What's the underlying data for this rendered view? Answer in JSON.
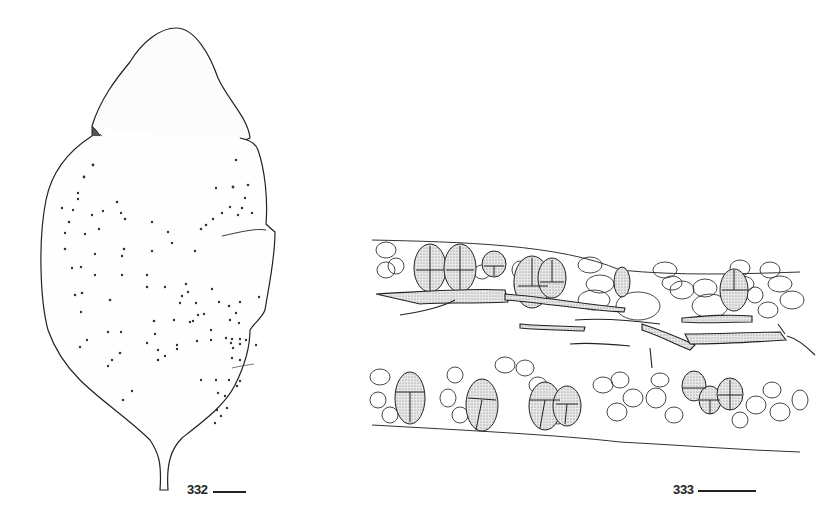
{
  "plate": {
    "figures": [
      {
        "number": "332",
        "label": "332",
        "subject": "leaf-like body with overlapping lobes and scattered dots",
        "scale_bar": "scale-bar"
      },
      {
        "number": "333",
        "label": "333",
        "subject": "cross-section strip with cells, stippled segmented cells and central filaments",
        "scale_bar": "scale-bar"
      }
    ],
    "colors": {
      "background": "#ffffff",
      "ink": "#222222",
      "stipple": "#8a8a8a"
    }
  }
}
